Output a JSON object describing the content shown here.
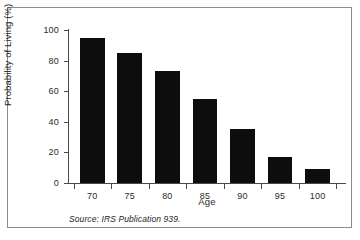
{
  "chart_data": {
    "type": "bar",
    "title": "",
    "xlabel": "Age",
    "ylabel": "Probability of Living (%)",
    "categories": [
      "70",
      "75",
      "80",
      "85",
      "90",
      "95",
      "100"
    ],
    "values": [
      95,
      85,
      73,
      55,
      35,
      17,
      9
    ],
    "ylim": [
      0,
      100
    ],
    "yticks": [
      0,
      20,
      40,
      60,
      80,
      100
    ],
    "ytick_labels": [
      "0",
      "20",
      "40",
      "60",
      "80",
      "100"
    ],
    "grid": false,
    "legend": false,
    "bar_color": "#0d0d0d",
    "axis_color": "#4a4a4a"
  },
  "source_note": "Source: IRS Publication 939.",
  "frame": {
    "border_color": "#8d8d8d"
  }
}
